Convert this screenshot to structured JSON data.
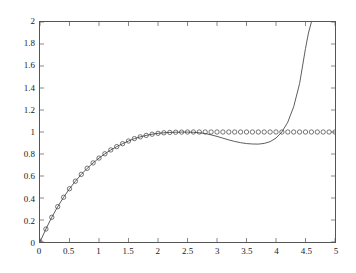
{
  "chart_data": {
    "type": "line",
    "title": "",
    "xlabel": "",
    "ylabel": "",
    "xlim": [
      0,
      5
    ],
    "ylim": [
      0,
      2
    ],
    "grid": false,
    "legend": "none",
    "background": "#ffffff",
    "axis_color": "#555555",
    "xticks": [
      0,
      0.5,
      1,
      1.5,
      2,
      2.5,
      3,
      3.5,
      4,
      4.5,
      5
    ],
    "xtick_labels": [
      "0",
      "0.5",
      "1",
      "1.5",
      "2",
      "2.5",
      "3",
      "3.5",
      "4",
      "4.5",
      "5"
    ],
    "yticks": [
      0,
      0.2,
      0.4,
      0.6,
      0.8,
      1,
      1.2,
      1.4,
      1.6,
      1.8,
      2
    ],
    "ytick_labels": [
      "0",
      "0.2",
      "0.4",
      "0.6",
      "0.8",
      "1",
      "1.2",
      "1.4",
      "1.6",
      "1.8",
      "2"
    ],
    "series": [
      {
        "name": "solid-curve",
        "style": "line",
        "color": "#4a4a4a",
        "linewidth": 0.9,
        "x": [
          0,
          0.1,
          0.2,
          0.3,
          0.4,
          0.5,
          0.6,
          0.7,
          0.8,
          0.9,
          1.0,
          1.1,
          1.2,
          1.3,
          1.4,
          1.5,
          1.6,
          1.7,
          1.8,
          1.9,
          2.0,
          2.1,
          2.2,
          2.3,
          2.4,
          2.5,
          2.6,
          2.7,
          2.8,
          2.9,
          3.0,
          3.1,
          3.2,
          3.3,
          3.4,
          3.5,
          3.6,
          3.7,
          3.8,
          3.9,
          4.0,
          4.1,
          4.2,
          4.3,
          4.4,
          4.5,
          4.55,
          4.6,
          4.65
        ],
        "y": [
          0,
          0.118,
          0.225,
          0.321,
          0.407,
          0.484,
          0.553,
          0.615,
          0.67,
          0.719,
          0.763,
          0.802,
          0.837,
          0.867,
          0.894,
          0.918,
          0.94,
          0.956,
          0.969,
          0.98,
          0.988,
          0.993,
          0.996,
          0.998,
          0.999,
          0.999,
          0.997,
          0.993,
          0.986,
          0.974,
          0.96,
          0.944,
          0.928,
          0.914,
          0.903,
          0.895,
          0.891,
          0.89,
          0.896,
          0.912,
          0.945,
          1.0,
          1.09,
          1.23,
          1.44,
          1.76,
          1.9,
          2.0,
          2.12
        ]
      },
      {
        "name": "circle-markers",
        "style": "markers",
        "marker": "o",
        "color": "#3c3c3c",
        "markersize": 2.2,
        "x": [
          0,
          0.1,
          0.2,
          0.3,
          0.4,
          0.5,
          0.6,
          0.7,
          0.8,
          0.9,
          1.0,
          1.1,
          1.2,
          1.3,
          1.4,
          1.5,
          1.6,
          1.7,
          1.8,
          1.9,
          2.0,
          2.1,
          2.2,
          2.3,
          2.4,
          2.5,
          2.6,
          2.7,
          2.8,
          2.9,
          3.0,
          3.1,
          3.2,
          3.3,
          3.4,
          3.5,
          3.6,
          3.7,
          3.8,
          3.9,
          4.0,
          4.1,
          4.2,
          4.3,
          4.4,
          4.5,
          4.6,
          4.7,
          4.8,
          4.9,
          5.0
        ],
        "y": [
          0,
          0.118,
          0.225,
          0.321,
          0.407,
          0.484,
          0.553,
          0.615,
          0.67,
          0.719,
          0.763,
          0.802,
          0.837,
          0.867,
          0.894,
          0.918,
          0.94,
          0.956,
          0.969,
          0.98,
          0.988,
          0.993,
          0.996,
          0.998,
          0.999,
          1.0,
          1.0,
          1.0,
          1.0,
          1.0,
          1.0,
          1.0,
          1.0,
          1.0,
          1.0,
          1.0,
          1.0,
          1.0,
          1.0,
          1.0,
          1.0,
          1.0,
          1.0,
          1.0,
          1.0,
          1.0,
          1.0,
          1.0,
          1.0,
          1.0,
          1.0
        ]
      }
    ],
    "annotations": []
  }
}
